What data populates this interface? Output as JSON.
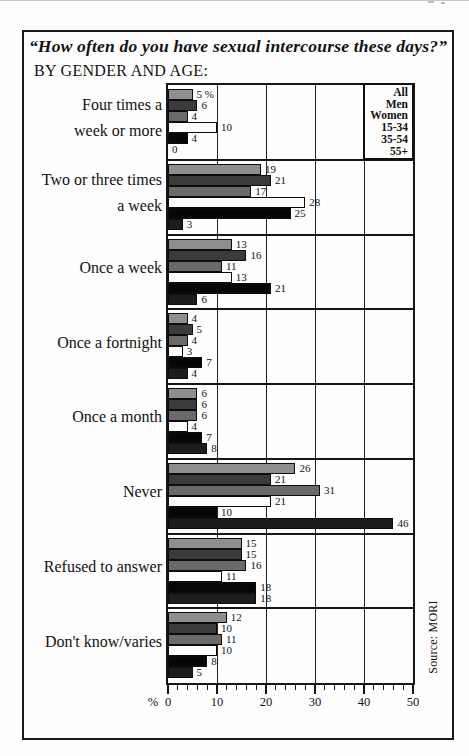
{
  "page": {
    "title": "“How often do you have sexual intercourse these days?”",
    "subtitle": "BY GENDER AND AGE:",
    "source": "Source: MORI"
  },
  "chart_data": {
    "type": "bar",
    "orientation": "horizontal",
    "title": "“How often do you have sexual intercourse these days?”",
    "subtitle": "BY GENDER AND AGE:",
    "source": "Source: MORI",
    "unit": "%",
    "xlim": [
      0,
      50
    ],
    "axis": {
      "prefix": "%",
      "major_ticks": [
        0,
        10,
        20,
        30,
        40,
        50
      ],
      "minor_step": 2
    },
    "grid": "on",
    "legend_position": "top-right",
    "series": [
      {
        "name": "All",
        "color": "#8e8e8e"
      },
      {
        "name": "Men",
        "color": "#3b3b3b"
      },
      {
        "name": "Women",
        "color": "#6a6a6a"
      },
      {
        "name": "15-34",
        "color": "#fdfdfd"
      },
      {
        "name": "35-54",
        "color": "#070707"
      },
      {
        "name": "55+",
        "color": "#1d1d1d"
      }
    ],
    "categories": [
      "Four times a week or more",
      "Two or three times a week",
      "Once a week",
      "Once a fortnight",
      "Once a month",
      "Never",
      "Refused to answer",
      "Don't know/varies"
    ],
    "groups": [
      {
        "label_lines": [
          "Four times a",
          "week or more"
        ],
        "values": [
          5,
          6,
          4,
          10,
          4,
          0
        ],
        "display": [
          "5 %",
          "6",
          "4",
          "10",
          "4",
          "0"
        ]
      },
      {
        "label_lines": [
          "Two or three times",
          "a week"
        ],
        "values": [
          19,
          21,
          17,
          28,
          25,
          3
        ],
        "display": [
          "19",
          "21",
          "17",
          "28",
          "25",
          "3"
        ]
      },
      {
        "label_lines": [
          "Once a week"
        ],
        "values": [
          13,
          16,
          11,
          13,
          21,
          6
        ],
        "display": [
          "13",
          "16",
          "11",
          "13",
          "21",
          "6"
        ]
      },
      {
        "label_lines": [
          "Once a fortnight"
        ],
        "values": [
          4,
          5,
          4,
          3,
          7,
          4
        ],
        "display": [
          "4",
          "5",
          "4",
          "3",
          "7",
          "4"
        ]
      },
      {
        "label_lines": [
          "Once a month"
        ],
        "values": [
          6,
          6,
          6,
          4,
          7,
          8
        ],
        "display": [
          "6",
          "6",
          "6",
          "4",
          "7",
          "8"
        ]
      },
      {
        "label_lines": [
          "Never"
        ],
        "values": [
          26,
          21,
          31,
          21,
          10,
          46
        ],
        "display": [
          "26",
          "21",
          "31",
          "21",
          "10",
          "46"
        ]
      },
      {
        "label_lines": [
          "Refused to answer"
        ],
        "values": [
          15,
          15,
          16,
          11,
          18,
          18
        ],
        "display": [
          "15",
          "15",
          "16",
          "11",
          "18",
          "18"
        ]
      },
      {
        "label_lines": [
          "Don't know/varies"
        ],
        "values": [
          12,
          10,
          11,
          10,
          8,
          5
        ],
        "display": [
          "12",
          "10",
          "11",
          "10",
          "8",
          "5"
        ]
      }
    ]
  }
}
